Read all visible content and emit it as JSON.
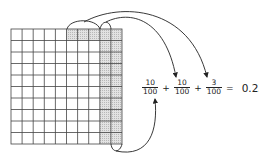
{
  "diagram": {
    "grid": {
      "rows": 10,
      "cols": 10,
      "shaded_full_columns": [
        8,
        9
      ],
      "shaded_top_row_cells": [
        5,
        6,
        7
      ]
    },
    "equation": {
      "terms": [
        {
          "numerator": "10",
          "denominator": "100"
        },
        {
          "numerator": "10",
          "denominator": "100"
        },
        {
          "numerator": "3",
          "denominator": "100"
        }
      ],
      "plus": "+",
      "equals": "=",
      "result": "0.23"
    },
    "colors": {
      "line": "#333333",
      "shade": "#d6d6d6"
    }
  }
}
